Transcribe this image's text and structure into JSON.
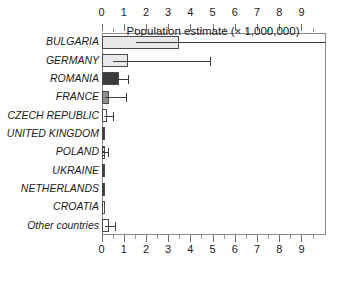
{
  "chart_data": {
    "type": "bar",
    "orientation": "horizontal",
    "title": "",
    "xlabel": "Population estimate (× 1,000,000)",
    "ylabel": "",
    "xlim": [
      0,
      10.08
    ],
    "xticks": [
      0,
      1,
      2,
      3,
      4,
      5,
      6,
      7,
      8,
      9
    ],
    "xtick_labels": [
      "0",
      "1",
      "2",
      "3",
      "4",
      "5",
      "6",
      "7",
      "8",
      "9"
    ],
    "minor_tick_step": 0.5,
    "grid": false,
    "legend": null,
    "axis_top": true,
    "axis_bottom": true,
    "categories": [
      "BULGARIA",
      "GERMANY",
      "ROMANIA",
      "FRANCE",
      "CZECH REPUBLIC",
      "UNITED KINGDOM",
      "POLAND",
      "UKRAINE",
      "NETHERLANDS",
      "CROATIA",
      "Other countries"
    ],
    "values": [
      3.5,
      1.2,
      0.78,
      0.36,
      0.26,
      0.16,
      0.12,
      0.11,
      0.1,
      0.09,
      0.35
    ],
    "error_high": [
      10.08,
      4.9,
      1.2,
      1.1,
      0.52,
      0.16,
      0.3,
      0.11,
      0.1,
      0.09,
      0.62
    ],
    "fills": [
      "light-gray",
      "light-gray",
      "dark-gray",
      "mid-gray",
      "white",
      "dark-gray",
      "hatched",
      "dark-gray",
      "dark-gray",
      "white",
      "white"
    ],
    "colors": {
      "light-gray": "#e9e9e9",
      "mid-gray": "#8f8f8f",
      "dark-gray": "#3b3b3b",
      "white": "#ffffff",
      "hatched": "#2f2f2f",
      "bar-outline": "#4a4a4a",
      "error-bar": "#3a3a3a",
      "axis": "#8a8a8a",
      "text": "#1a1a1a",
      "background": "#ffffff"
    }
  }
}
